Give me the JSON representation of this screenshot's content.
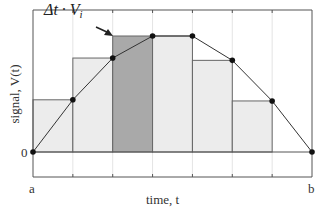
{
  "chart_data": {
    "type": "bar",
    "subtype": "riemann-sum-with-line",
    "title": "",
    "xlabel": "time, t",
    "ylabel": "signal, V(t)",
    "x_tick_labels": [
      {
        "pos": 0,
        "label": "a"
      },
      {
        "pos": 7,
        "label": "b"
      }
    ],
    "y_tick_labels": [
      {
        "pos": 0,
        "label": "0"
      }
    ],
    "annotation": {
      "text": "Δt · V",
      "subscript": "i",
      "points_to_bar": 2
    },
    "grid": true,
    "line_points": {
      "x": [
        0,
        1,
        2,
        3,
        4,
        5,
        6,
        7
      ],
      "y": [
        0,
        0.45,
        0.81,
        1.0,
        1.0,
        0.79,
        0.44,
        0
      ]
    },
    "bars": [
      {
        "x0": 0,
        "x1": 1,
        "height": 0.45,
        "highlight": false
      },
      {
        "x0": 1,
        "x1": 2,
        "height": 0.81,
        "highlight": false
      },
      {
        "x0": 2,
        "x1": 3,
        "height": 1.0,
        "highlight": true
      },
      {
        "x0": 3,
        "x1": 4,
        "height": 1.0,
        "highlight": false
      },
      {
        "x0": 4,
        "x1": 5,
        "height": 0.79,
        "highlight": false
      },
      {
        "x0": 5,
        "x1": 6,
        "height": 0.44,
        "highlight": false
      }
    ],
    "xlim": [
      0,
      7
    ],
    "ylim": [
      -0.22,
      1.2
    ],
    "colors": {
      "bar": "#ececec",
      "highlight": "#a9a9a9",
      "line": "#333333",
      "point": "#111111",
      "grid": "#e4e4e4",
      "frame": "#555555"
    }
  },
  "labels": {
    "xlabel": "time, t",
    "ylabel": "signal, V(t)",
    "a": "a",
    "b": "b",
    "zero": "0",
    "annot_main": "Δt · V",
    "annot_sub": "i"
  }
}
